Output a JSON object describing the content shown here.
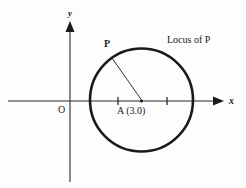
{
  "figure": {
    "kind": "coordinate-geometry-diagram",
    "background_color": "#fdfdfd",
    "ink_color": "#1a1a1a",
    "axes": {
      "x_axis_label": "x",
      "y_axis_label": "y",
      "origin_label": "O",
      "x_axis_y_px": 101,
      "y_axis_x_px": 70,
      "x_axis_start_px": 8,
      "x_axis_end_px": 224,
      "y_axis_top_px": 22,
      "y_axis_bottom_px": 182,
      "tick_marks_px": [
        118,
        167
      ],
      "tick_half_height_px": 4
    },
    "circle": {
      "center_x_px": 141.5,
      "center_y_px": 100,
      "radius_px": 51.5,
      "stroke_width_px": 2.6,
      "stroke_color": "#1a1a1a",
      "fill": "none"
    },
    "center_point": {
      "label": "A (3.0)",
      "marker_x_px": 141.5,
      "marker_y_px": 101,
      "label_x_px": 118,
      "label_y_px": 106
    },
    "locus_point": {
      "label": "P",
      "point_x_px": 112,
      "point_y_px": 58,
      "label_x_px": 104,
      "label_y_px": 44
    },
    "radius_segment": {
      "from_x_px": 112,
      "from_y_px": 58,
      "to_x_px": 141.5,
      "to_y_px": 100,
      "stroke_width_px": 0.9
    },
    "annotation": {
      "locus_caption": "Locus of P",
      "caption_x_px": 167,
      "caption_y_px": 40
    }
  }
}
